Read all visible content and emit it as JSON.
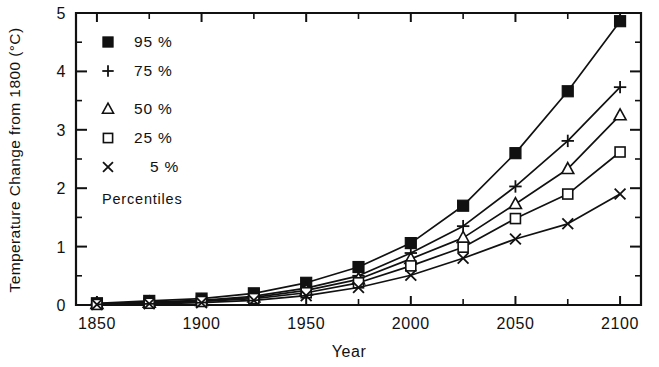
{
  "chart_data": {
    "type": "line",
    "title": "",
    "xlabel": "Year",
    "ylabel": "Temperature Change from 1800 (°C)",
    "xlim": [
      1840,
      2110
    ],
    "ylim": [
      0,
      5
    ],
    "x": [
      1850,
      1875,
      1900,
      1925,
      1950,
      1975,
      2000,
      2025,
      2050,
      2075,
      2100
    ],
    "xticks": [
      1850,
      1900,
      1950,
      2000,
      2050,
      2100
    ],
    "xtick_labels": [
      "1850",
      "1900",
      "1950",
      "2000",
      "2050",
      "2100"
    ],
    "xminor_ticks": [
      1875,
      1925,
      1975,
      2025,
      2075
    ],
    "yticks": [
      0,
      1,
      2,
      3,
      4,
      5
    ],
    "ytick_labels": [
      "0",
      "1",
      "2",
      "3",
      "4",
      "5"
    ],
    "grid": false,
    "legend_position": "upper-left-inside",
    "legend_caption": "Percentiles",
    "series": [
      {
        "name": "95 %",
        "marker": "filled-square",
        "values": [
          0.03,
          0.07,
          0.11,
          0.2,
          0.38,
          0.65,
          1.06,
          1.7,
          2.6,
          3.66,
          4.86
        ]
      },
      {
        "name": "75 %",
        "marker": "plus",
        "values": [
          0.02,
          0.05,
          0.08,
          0.15,
          0.29,
          0.5,
          0.89,
          1.35,
          2.03,
          2.81,
          3.73
        ]
      },
      {
        "name": "50 %",
        "marker": "triangle",
        "values": [
          0.02,
          0.04,
          0.07,
          0.13,
          0.25,
          0.44,
          0.79,
          1.15,
          1.73,
          2.33,
          3.25
        ]
      },
      {
        "name": "25 %",
        "marker": "open-square",
        "values": [
          0.01,
          0.03,
          0.06,
          0.11,
          0.21,
          0.38,
          0.67,
          0.99,
          1.48,
          1.9,
          2.62
        ]
      },
      {
        "name": "5 %",
        "marker": "cross",
        "values": [
          0.01,
          0.02,
          0.04,
          0.08,
          0.16,
          0.3,
          0.51,
          0.8,
          1.13,
          1.39,
          1.9
        ]
      }
    ],
    "colors": {
      "ink": "#111111",
      "background": "#ffffff"
    }
  }
}
